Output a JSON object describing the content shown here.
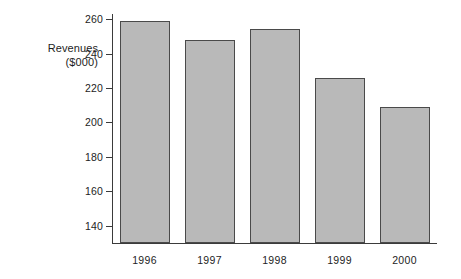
{
  "chart_data": {
    "type": "bar",
    "title": "",
    "subtitle": "",
    "xlabel": "",
    "ylabel": "Revenues ($000)",
    "ylabel_lines": [
      "Revenues",
      "($000)"
    ],
    "categories": [
      "1996",
      "1997",
      "1998",
      "1999",
      "2000"
    ],
    "values": [
      259,
      248,
      254,
      226,
      209
    ],
    "series": [
      {
        "name": "Revenues",
        "values": [
          259,
          248,
          254,
          226,
          209
        ]
      }
    ],
    "ylim": [
      130,
      263
    ],
    "y_ticks": [
      140,
      160,
      180,
      200,
      220,
      240,
      260
    ],
    "y_tick_labels": [
      "140",
      "160",
      "180",
      "200",
      "220",
      "240",
      "260"
    ],
    "grid": false,
    "legend": "none",
    "bar_fill_color": "#b9b9b9",
    "bar_border_color": "#4a4a4a",
    "axis_color": "#3b3b3b",
    "background_color": "#ffffff"
  }
}
